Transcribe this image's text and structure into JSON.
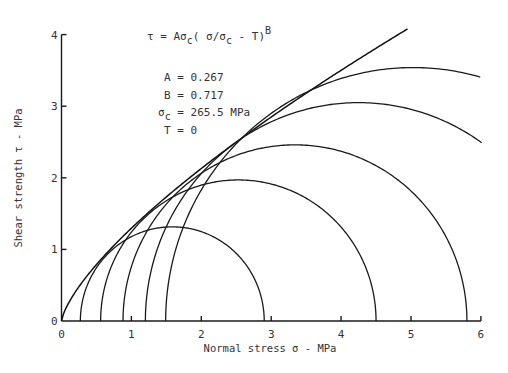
{
  "chart_data": {
    "type": "line",
    "title": "",
    "xlabel": "Normal stress  σ - MPa",
    "ylabel": "Shear strength τ - MPa",
    "xlim": [
      0,
      6
    ],
    "ylim": [
      0,
      4
    ],
    "x_ticks": [
      "0",
      "1",
      "2",
      "3",
      "4",
      "5",
      "6"
    ],
    "y_ticks": [
      "0",
      "1",
      "2",
      "3",
      "4"
    ],
    "grid": false,
    "envelope": {
      "name": "Power-law failure envelope",
      "equation": "τ = Aσc(σ/σc - T)^B",
      "A": 0.267,
      "B": 0.717,
      "sigma_c": 265.5,
      "T": 0,
      "x_end": 4.95
    },
    "mohr_circles": [
      {
        "sigma3": 0.0,
        "sigma1": 0.0
      },
      {
        "sigma3": 0.27,
        "sigma1": 2.9
      },
      {
        "sigma3": 0.56,
        "sigma1": 4.5
      },
      {
        "sigma3": 0.88,
        "sigma1": 5.8
      },
      {
        "sigma3": 1.2,
        "sigma1": 7.3
      },
      {
        "sigma3": 1.49,
        "sigma1": 8.57
      }
    ]
  },
  "annotation": {
    "equation_lhs": "τ = Aσ",
    "equation_sub": "c",
    "equation_mid": "( σ/σ",
    "equation_sub2": "c",
    "equation_rhs": " - T)",
    "equation_sup": "B",
    "A_line": "A = 0.267",
    "B_line": "B = 0.717",
    "sigc_sym": "σ",
    "sigc_sub": "c",
    "sigc_val": "= 265.5 MPa",
    "T_line": "T = 0"
  }
}
